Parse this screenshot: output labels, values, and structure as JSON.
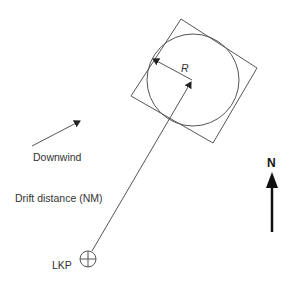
{
  "diagram": {
    "labels": {
      "downwind": "Downwind",
      "drift_distance": "Drift distance (NM)",
      "lkp": "LKP",
      "radius": "R",
      "north": "N"
    },
    "colors": {
      "line": "#555555",
      "text": "#333333",
      "north_arrow": "#111111",
      "background": "#ffffff"
    },
    "shapes": {
      "search_square": {
        "corners": [
          [
            181,
            19
          ],
          [
            257,
            68
          ],
          [
            213,
            143
          ],
          [
            131,
            96
          ]
        ]
      },
      "search_circle": {
        "cx": 193,
        "cy": 80,
        "r": 46
      },
      "datum_point": {
        "x": 192,
        "y": 80
      },
      "lkp_marker": {
        "cx": 88,
        "cy": 259,
        "r": 8
      },
      "drift_line": {
        "from": [
          92,
          251
        ],
        "to": [
          192,
          80
        ]
      },
      "radius_arrow": {
        "from": [
          192,
          80
        ],
        "to": [
          152,
          58
        ]
      },
      "downwind_arrow": {
        "from": [
          32,
          146
        ],
        "to": [
          81,
          120
        ]
      },
      "north_arrow": {
        "x": 272,
        "from_y": 232,
        "to_y": 172
      }
    }
  }
}
